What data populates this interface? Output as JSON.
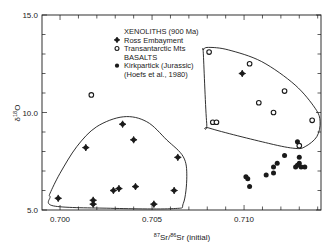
{
  "chart_data": {
    "type": "scatter",
    "title": "",
    "xlabel": "87Sr/86Sr (initial)",
    "xlabel_parts": {
      "sup1": "87",
      "base1": "Sr/",
      "sup2": "86",
      "base2": "Sr (initial)"
    },
    "ylabel": "δ18O",
    "ylabel_parts": {
      "base": "δ",
      "sup": "18",
      "tail": "O"
    },
    "xlim": [
      0.69902,
      0.71418
    ],
    "ylim": [
      5.0,
      15.0
    ],
    "x_ticks_major": [
      {
        "value": 0.7,
        "label": "0.700"
      },
      {
        "value": 0.705,
        "label": "0.705"
      },
      {
        "value": 0.71,
        "label": "0.710"
      }
    ],
    "x_tick_minor_step": 0.001,
    "y_ticks_major": [
      {
        "value": 5.0,
        "label": "5.0"
      },
      {
        "value": 10.0,
        "label": "10.0"
      },
      {
        "value": 15.0,
        "label": "15.0"
      }
    ],
    "y_tick_minor_step": 1.0,
    "grid": false,
    "legend": {
      "position": "upper-center",
      "entries": [
        {
          "kind": "header",
          "text": "XENOLITHS (900 Ma)"
        },
        {
          "kind": "series",
          "series": "ross",
          "text": "Ross Embayment"
        },
        {
          "kind": "series",
          "series": "transantarctic",
          "text": "Transantarctic Mts"
        },
        {
          "kind": "header",
          "text": "BASALTS"
        },
        {
          "kind": "series",
          "series": "kirkpatrick",
          "text": "Kirkpartick (Jurassic)"
        },
        {
          "kind": "header",
          "text": "(Hoefs et al., 1980)"
        }
      ]
    },
    "series": [
      {
        "id": "ross",
        "name": "Ross Embayment",
        "group": "XENOLITHS (900 Ma)",
        "marker": "filled-diamond",
        "points": [
          [
            0.6999,
            5.6
          ],
          [
            0.7014,
            8.2
          ],
          [
            0.7018,
            5.5
          ],
          [
            0.7018,
            5.3
          ],
          [
            0.7034,
            9.4
          ],
          [
            0.704,
            8.6
          ],
          [
            0.7029,
            6.0
          ],
          [
            0.7032,
            6.1
          ],
          [
            0.7041,
            6.2
          ],
          [
            0.7064,
            7.7
          ],
          [
            0.7062,
            6.0
          ],
          [
            0.7051,
            5.3
          ],
          [
            0.7099,
            12.0
          ]
        ]
      },
      {
        "id": "transantarctic",
        "name": "Transantarctic Mts",
        "group": "XENOLITHS (900 Ma)",
        "marker": "open-circle",
        "points": [
          [
            0.7017,
            10.9
          ],
          [
            0.7081,
            13.1
          ],
          [
            0.7103,
            12.5
          ],
          [
            0.7122,
            11.1
          ],
          [
            0.7108,
            10.5
          ],
          [
            0.7116,
            10.0
          ],
          [
            0.7083,
            9.5
          ],
          [
            0.7085,
            9.5
          ],
          [
            0.7137,
            9.6
          ],
          [
            0.713,
            8.3
          ]
        ]
      },
      {
        "id": "kirkpatrick",
        "name": "Kirkpartick (Jurassic)",
        "group": "BASALTS",
        "marker": "filled-circle",
        "points": [
          [
            0.7129,
            8.5
          ],
          [
            0.7101,
            6.7
          ],
          [
            0.7102,
            6.6
          ],
          [
            0.7103,
            6.2
          ],
          [
            0.7112,
            6.8
          ],
          [
            0.7116,
            6.9
          ],
          [
            0.7116,
            7.2
          ],
          [
            0.7118,
            7.4
          ],
          [
            0.7122,
            7.8
          ],
          [
            0.713,
            7.7
          ],
          [
            0.713,
            7.4
          ],
          [
            0.7128,
            7.2
          ],
          [
            0.7131,
            7.2
          ],
          [
            0.7133,
            7.2
          ],
          [
            0.7129,
            7.3
          ]
        ]
      }
    ],
    "annotations": [
      {
        "type": "hull-outline",
        "name": "left-field-outline",
        "points": [
          [
            0.69946,
            5.86
          ],
          [
            0.7,
            6.88
          ],
          [
            0.70091,
            8.25
          ],
          [
            0.70199,
            9.27
          ],
          [
            0.70344,
            9.78
          ],
          [
            0.70471,
            9.53
          ],
          [
            0.7058,
            8.59
          ],
          [
            0.7067,
            7.73
          ],
          [
            0.70689,
            6.71
          ],
          [
            0.7067,
            5.34
          ],
          [
            0.70616,
            5.07
          ],
          [
            0.70254,
            5.09
          ],
          [
            0.69964,
            5.21
          ],
          [
            0.69946,
            5.68
          ]
        ]
      },
      {
        "type": "hull-outline",
        "name": "right-field-outline",
        "points": [
          [
            0.70779,
            13.21
          ],
          [
            0.70806,
            13.34
          ],
          [
            0.70915,
            13.21
          ],
          [
            0.71096,
            12.61
          ],
          [
            0.71277,
            11.41
          ],
          [
            0.71386,
            10.22
          ],
          [
            0.71413,
            9.53
          ],
          [
            0.71395,
            8.76
          ],
          [
            0.71332,
            8.25
          ],
          [
            0.71277,
            8.16
          ],
          [
            0.71132,
            8.42
          ],
          [
            0.70815,
            9.19
          ],
          [
            0.70797,
            9.45
          ],
          [
            0.70779,
            12.95
          ]
        ]
      }
    ]
  },
  "style": {
    "ink": "#1a1a1a",
    "background": "#ffffff"
  },
  "layout": {
    "plot_left": 42,
    "plot_right": 321,
    "plot_top": 15,
    "plot_bottom": 210
  }
}
